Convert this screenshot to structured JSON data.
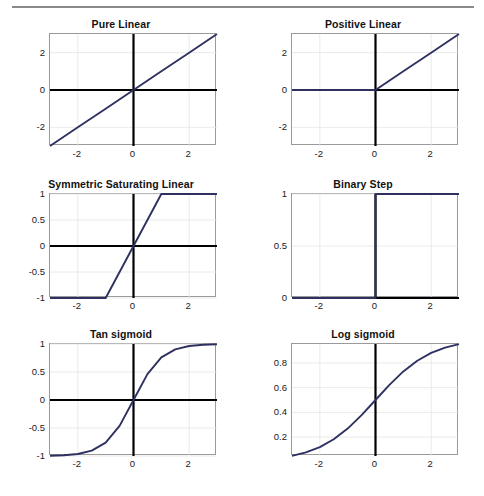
{
  "figure": {
    "caption": "",
    "line_color": "#2e3160",
    "axis_color": "#000000",
    "grid_color": "#e4e4e4",
    "box_color": "#9a9a9a"
  },
  "chart_data": [
    {
      "type": "line",
      "title": "Pure Linear",
      "xlabel": "",
      "ylabel": "",
      "xlim": [
        -3,
        3
      ],
      "ylim": [
        -3,
        3
      ],
      "xticks": [
        -2,
        0,
        2
      ],
      "xticklabels": [
        "-2",
        "0",
        "2"
      ],
      "yticks": [
        -2,
        0,
        2
      ],
      "yticklabels": [
        "-2",
        "0",
        "2"
      ],
      "grid": true,
      "legend": "none",
      "series": [
        {
          "name": "purelin(x) = x",
          "x": [
            -3,
            -2,
            -1,
            0,
            1,
            2,
            3
          ],
          "values": [
            -3,
            -2,
            -1,
            0,
            1,
            2,
            3
          ]
        }
      ]
    },
    {
      "type": "line",
      "title": "Positive Linear",
      "xlabel": "",
      "ylabel": "",
      "xlim": [
        -3,
        3
      ],
      "ylim": [
        -3,
        3
      ],
      "xticks": [
        -2,
        0,
        2
      ],
      "xticklabels": [
        "-2",
        "0",
        "2"
      ],
      "yticks": [
        -2,
        0,
        2
      ],
      "yticklabels": [
        "-2",
        "0",
        "2"
      ],
      "grid": true,
      "legend": "none",
      "series": [
        {
          "name": "poslin(x) = max(0, x)",
          "x": [
            -3,
            -2,
            -1,
            0,
            1,
            2,
            3
          ],
          "values": [
            0,
            0,
            0,
            0,
            1,
            2,
            3
          ]
        }
      ]
    },
    {
      "type": "line",
      "title": "Symmetric Saturating Linear",
      "xlabel": "",
      "ylabel": "",
      "xlim": [
        -3,
        3
      ],
      "ylim": [
        -1,
        1
      ],
      "xticks": [
        -2,
        0,
        2
      ],
      "xticklabels": [
        "-2",
        "0",
        "2"
      ],
      "yticks": [
        -1,
        -0.5,
        0,
        0.5,
        1
      ],
      "yticklabels": [
        "-1",
        "-0.5",
        "0",
        "0.5",
        "1"
      ],
      "grid": true,
      "legend": "none",
      "series": [
        {
          "name": "satlins(x)",
          "x": [
            -3,
            -2,
            -1,
            0,
            1,
            2,
            3
          ],
          "values": [
            -1,
            -1,
            -1,
            0,
            1,
            1,
            1
          ]
        }
      ]
    },
    {
      "type": "line",
      "title": "Binary Step",
      "xlabel": "",
      "ylabel": "",
      "xlim": [
        -3,
        3
      ],
      "ylim": [
        0,
        1
      ],
      "xticks": [
        -2,
        0,
        2
      ],
      "xticklabels": [
        "-2",
        "0",
        "2"
      ],
      "yticks": [
        0,
        0.5,
        1
      ],
      "yticklabels": [
        "0",
        "0.5",
        "1"
      ],
      "grid": true,
      "legend": "none",
      "series": [
        {
          "name": "hardlim(x)",
          "x": [
            -3,
            -2,
            -1,
            0,
            0,
            1,
            2,
            3
          ],
          "values": [
            0,
            0,
            0,
            0,
            1,
            1,
            1,
            1
          ]
        }
      ]
    },
    {
      "type": "line",
      "title": "Tan sigmoid",
      "xlabel": "",
      "ylabel": "",
      "xlim": [
        -3,
        3
      ],
      "ylim": [
        -1,
        1
      ],
      "xticks": [
        -2,
        0,
        2
      ],
      "xticklabels": [
        "-2",
        "0",
        "2"
      ],
      "yticks": [
        -1,
        -0.5,
        0,
        0.5,
        1
      ],
      "yticklabels": [
        "-1",
        "-0.5",
        "0",
        "0.5",
        "1"
      ],
      "grid": true,
      "legend": "none",
      "series": [
        {
          "name": "tansig(x) = tanh(x)",
          "x": [
            -3,
            -2.5,
            -2,
            -1.5,
            -1,
            -0.5,
            0,
            0.5,
            1,
            1.5,
            2,
            2.5,
            3
          ],
          "values": [
            -0.995,
            -0.987,
            -0.964,
            -0.905,
            -0.762,
            -0.462,
            0,
            0.462,
            0.762,
            0.905,
            0.964,
            0.987,
            0.995
          ]
        }
      ]
    },
    {
      "type": "line",
      "title": "Log sigmoid",
      "xlabel": "",
      "ylabel": "",
      "xlim": [
        -3,
        3
      ],
      "ylim": [
        0.047,
        0.953
      ],
      "xticks": [
        -2,
        0,
        2
      ],
      "xticklabels": [
        "-2",
        "0",
        "2"
      ],
      "yticks": [
        0.2,
        0.4,
        0.6,
        0.8
      ],
      "yticklabels": [
        "0.2",
        "0.4",
        "0.6",
        "0.8"
      ],
      "grid": true,
      "legend": "none",
      "series": [
        {
          "name": "logsig(x) = 1/(1+e^-x)",
          "x": [
            -3,
            -2.5,
            -2,
            -1.5,
            -1,
            -0.5,
            0,
            0.5,
            1,
            1.5,
            2,
            2.5,
            3
          ],
          "values": [
            0.0474,
            0.0759,
            0.1192,
            0.1824,
            0.2689,
            0.3775,
            0.5,
            0.6225,
            0.7311,
            0.8176,
            0.8808,
            0.9241,
            0.9526
          ]
        }
      ]
    }
  ]
}
